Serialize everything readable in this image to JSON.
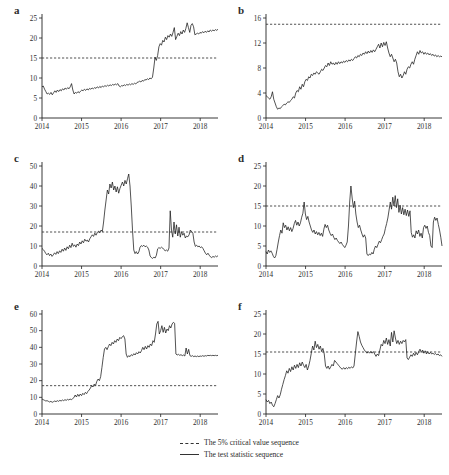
{
  "figure": {
    "panels": [
      {
        "id": "a",
        "label": "a",
        "ylim": [
          0,
          25
        ],
        "yticks": [
          0,
          5,
          10,
          15,
          20,
          25
        ],
        "xticks": [
          "2014",
          "2015",
          "2016",
          "2017",
          "2018"
        ],
        "critical_value": 15,
        "series_name": "The test statistic sequence",
        "values": [
          7.8,
          8.0,
          7.2,
          6.6,
          6.0,
          6.2,
          5.9,
          6.4,
          5.8,
          6.3,
          6.8,
          6.4,
          7.0,
          6.6,
          7.1,
          6.8,
          7.3,
          7.0,
          7.5,
          7.2,
          7.6,
          7.3,
          7.8,
          8.6,
          7.0,
          6.0,
          6.4,
          6.2,
          6.6,
          6.3,
          6.7,
          7.0,
          6.8,
          7.2,
          6.9,
          7.3,
          7.0,
          7.4,
          7.2,
          7.5,
          7.3,
          7.6,
          7.4,
          7.8,
          7.5,
          7.9,
          7.6,
          8.0,
          7.8,
          8.1,
          7.9,
          8.2,
          8.0,
          8.3,
          8.1,
          8.4,
          8.2,
          8.5,
          8.3,
          8.6,
          8.0,
          7.8,
          8.1,
          8.0,
          8.3,
          8.1,
          8.4,
          8.2,
          8.5,
          8.3,
          8.6,
          8.4,
          8.7,
          8.5,
          8.9,
          9.0,
          9.2,
          9.0,
          9.4,
          9.2,
          9.6,
          9.5,
          9.8,
          9.6,
          10.0,
          9.8,
          10.2,
          12.5,
          15.2,
          14.4,
          15.6,
          17.8,
          18.6,
          18.2,
          19.4,
          19.0,
          20.2,
          19.6,
          20.6,
          20.2,
          21.0,
          20.4,
          21.4,
          22.6,
          19.6,
          20.4,
          21.2,
          20.6,
          21.6,
          21.0,
          22.0,
          21.4,
          22.4,
          23.8,
          22.6,
          21.4,
          23.2,
          23.6,
          22.8,
          20.8,
          21.0,
          21.2,
          21.0,
          21.4,
          21.2,
          21.6,
          21.3,
          21.7,
          21.4,
          21.8,
          21.5,
          22.0,
          21.7,
          22.0,
          21.8,
          22.1,
          21.9,
          22.2
        ]
      },
      {
        "id": "b",
        "label": "b",
        "ylim": [
          0,
          16
        ],
        "yticks": [
          0,
          4,
          8,
          12,
          16
        ],
        "xticks": [
          "2014",
          "2015",
          "2016",
          "2017",
          "2018"
        ],
        "critical_value": 15,
        "series_name": "The test statistic sequence",
        "values": [
          3.6,
          3.4,
          3.2,
          3.0,
          3.4,
          4.2,
          3.0,
          2.4,
          1.8,
          1.4,
          1.6,
          1.5,
          1.8,
          2.0,
          2.2,
          2.1,
          2.4,
          2.6,
          2.5,
          2.8,
          3.0,
          3.4,
          3.2,
          4.0,
          4.4,
          4.2,
          5.0,
          4.6,
          5.4,
          5.0,
          5.8,
          6.2,
          6.0,
          6.6,
          6.4,
          7.0,
          6.8,
          7.2,
          7.0,
          7.4,
          7.2,
          7.0,
          7.4,
          7.8,
          7.6,
          8.0,
          8.4,
          8.2,
          8.8,
          8.4,
          9.0,
          8.6,
          8.8,
          8.5,
          8.9,
          8.6,
          9.0,
          8.7,
          9.0,
          8.8,
          9.1,
          8.9,
          9.2,
          9.0,
          9.3,
          9.1,
          9.4,
          9.2,
          9.5,
          9.8,
          9.6,
          10.0,
          9.8,
          10.2,
          10.0,
          10.4,
          10.2,
          10.6,
          10.3,
          10.7,
          10.4,
          10.8,
          10.5,
          10.9,
          10.6,
          11.0,
          11.4,
          11.8,
          11.2,
          12.0,
          11.4,
          12.1,
          11.6,
          12.2,
          11.2,
          10.4,
          9.8,
          10.2,
          9.6,
          9.0,
          9.4,
          8.8,
          7.4,
          6.6,
          7.0,
          6.4,
          6.8,
          7.4,
          7.0,
          7.8,
          8.2,
          8.0,
          8.6,
          9.0,
          8.6,
          9.4,
          10.0,
          10.6,
          10.2,
          10.8,
          10.4,
          10.6,
          10.2,
          10.5,
          10.2,
          10.4,
          10.1,
          10.3,
          10.0,
          10.2,
          9.9,
          10.1,
          9.8,
          10.0,
          9.8,
          9.9,
          9.8
        ]
      },
      {
        "id": "c",
        "label": "c",
        "ylim": [
          0,
          50
        ],
        "yticks": [
          0,
          10,
          20,
          30,
          40,
          50
        ],
        "xticks": [
          "2014",
          "2015",
          "2016",
          "2017",
          "2018"
        ],
        "critical_value": 17,
        "series_name": "The test statistic sequence",
        "values": [
          8.8,
          8.2,
          7.4,
          6.2,
          5.6,
          6.4,
          5.2,
          6.0,
          4.8,
          5.6,
          6.6,
          5.8,
          7.2,
          6.2,
          7.6,
          6.8,
          8.4,
          7.4,
          9.0,
          7.8,
          9.6,
          8.6,
          10.4,
          9.2,
          11.4,
          9.8,
          10.6,
          9.4,
          11.0,
          10.2,
          12.0,
          11.0,
          12.6,
          11.6,
          13.4,
          12.4,
          13.0,
          12.0,
          13.6,
          14.6,
          15.6,
          14.8,
          16.4,
          15.4,
          16.8,
          17.4,
          16.6,
          18.0,
          17.2,
          22.0,
          28.0,
          33.0,
          38.0,
          36.0,
          41.0,
          39.0,
          42.0,
          38.0,
          40.0,
          37.0,
          39.6,
          36.4,
          38.8,
          40.4,
          42.0,
          40.0,
          42.8,
          41.0,
          43.6,
          46.0,
          40.0,
          30.0,
          18.0,
          8.0,
          6.2,
          7.2,
          6.0,
          7.0,
          9.4,
          10.2,
          9.8,
          10.4,
          9.6,
          10.0,
          9.4,
          8.0,
          5.0,
          4.2,
          3.8,
          4.4,
          4.0,
          5.4,
          8.6,
          9.2,
          8.8,
          9.4,
          9.0,
          8.2,
          7.6,
          8.0,
          7.4,
          9.0,
          27.6,
          18.0,
          14.4,
          22.0,
          16.0,
          20.6,
          15.0,
          19.4,
          14.4,
          17.2,
          15.4,
          16.4,
          14.0,
          15.0,
          14.6,
          15.6,
          18.0,
          17.2,
          16.4,
          12.0,
          9.8,
          10.4,
          9.6,
          10.0,
          9.2,
          9.6,
          8.8,
          7.6,
          6.4,
          5.6,
          6.4,
          5.4,
          4.6,
          4.2,
          4.8,
          4.4,
          5.0,
          4.6,
          5.2
        ]
      },
      {
        "id": "d",
        "label": "d",
        "ylim": [
          0,
          25
        ],
        "yticks": [
          0,
          5,
          10,
          15,
          20,
          25
        ],
        "xticks": [
          "2014",
          "2015",
          "2016",
          "2017",
          "2018"
        ],
        "critical_value": 15,
        "series_name": "The test statistic sequence",
        "values": [
          3.6,
          3.0,
          4.0,
          3.4,
          3.8,
          3.2,
          2.4,
          2.0,
          2.6,
          4.2,
          6.0,
          7.6,
          9.0,
          8.2,
          10.8,
          9.6,
          10.2,
          9.0,
          9.8,
          8.8,
          9.6,
          8.6,
          9.4,
          10.6,
          11.4,
          10.2,
          11.0,
          10.0,
          10.8,
          12.2,
          13.2,
          16.0,
          13.0,
          11.6,
          12.4,
          11.0,
          10.0,
          9.0,
          8.4,
          9.0,
          8.0,
          8.6,
          7.8,
          8.4,
          7.6,
          8.2,
          7.4,
          9.2,
          10.4,
          9.6,
          10.2,
          9.0,
          8.2,
          7.6,
          8.0,
          7.2,
          6.6,
          7.0,
          6.4,
          6.0,
          5.6,
          6.0,
          5.4,
          5.0,
          4.6,
          5.2,
          6.0,
          10.0,
          16.0,
          20.0,
          17.0,
          14.6,
          16.2,
          13.0,
          11.0,
          9.6,
          10.2,
          9.0,
          8.0,
          7.2,
          7.8,
          7.0,
          3.0,
          2.6,
          3.0,
          2.8,
          3.4,
          3.0,
          4.2,
          5.0,
          4.6,
          5.4,
          6.2,
          5.8,
          6.6,
          7.4,
          8.0,
          9.4,
          10.6,
          12.0,
          14.0,
          16.0,
          14.2,
          17.2,
          15.0,
          17.6,
          14.6,
          16.8,
          13.4,
          15.2,
          13.0,
          14.6,
          12.8,
          14.2,
          12.6,
          14.0,
          12.4,
          13.8,
          8.4,
          7.2,
          7.8,
          7.0,
          8.8,
          8.0,
          9.0,
          7.4,
          8.2,
          7.0,
          9.6,
          10.2,
          9.4,
          10.0,
          8.4,
          7.6,
          5.0,
          4.6,
          11.0,
          12.2,
          11.4,
          12.0,
          10.4,
          9.0,
          7.2,
          5.0
        ]
      },
      {
        "id": "e",
        "label": "e",
        "ylim": [
          0,
          60
        ],
        "yticks": [
          0,
          10,
          20,
          30,
          40,
          50,
          60
        ],
        "xticks": [
          "2014",
          "2015",
          "2016",
          "2017",
          "2018"
        ],
        "critical_value": 17,
        "series_name": "The test statistic sequence",
        "values": [
          9.0,
          8.6,
          8.2,
          7.8,
          8.0,
          7.6,
          7.2,
          7.6,
          7.0,
          7.4,
          7.8,
          7.4,
          8.0,
          7.6,
          8.2,
          7.8,
          8.4,
          8.0,
          8.6,
          8.2,
          8.8,
          8.4,
          9.0,
          8.6,
          9.2,
          9.8,
          11.4,
          10.2,
          11.8,
          10.6,
          12.0,
          11.0,
          12.4,
          11.6,
          13.0,
          12.2,
          13.6,
          14.4,
          15.6,
          17.0,
          16.2,
          18.0,
          17.2,
          19.6,
          21.0,
          20.0,
          22.4,
          28.0,
          34.0,
          39.0,
          40.0,
          38.6,
          40.4,
          42.0,
          41.0,
          43.0,
          42.0,
          44.0,
          43.0,
          45.0,
          44.0,
          46.0,
          45.2,
          46.4,
          47.0,
          45.0,
          36.0,
          34.0,
          35.0,
          34.4,
          35.6,
          35.0,
          36.2,
          35.4,
          36.8,
          36.0,
          37.4,
          36.6,
          38.0,
          40.0,
          38.6,
          40.6,
          39.0,
          41.0,
          40.0,
          42.0,
          41.0,
          44.0,
          43.0,
          48.0,
          54.0,
          55.6,
          48.0,
          50.0,
          53.0,
          49.0,
          52.0,
          48.6,
          51.0,
          50.0,
          53.0,
          51.6,
          54.0,
          55.0,
          54.4,
          36.0,
          35.4,
          35.8,
          35.2,
          35.6,
          35.0,
          35.4,
          34.8,
          39.6,
          36.0,
          38.8,
          35.0,
          34.6,
          35.0,
          34.4,
          34.8,
          34.4,
          34.8,
          34.4,
          34.8,
          34.6,
          35.0,
          34.6,
          35.0,
          34.8,
          35.2,
          35.0,
          35.2,
          35.0,
          35.2,
          35.0,
          35.2,
          35.0,
          35.2
        ]
      },
      {
        "id": "f",
        "label": "f",
        "ylim": [
          0,
          25
        ],
        "yticks": [
          0,
          5,
          10,
          15,
          20,
          25
        ],
        "xticks": [
          "2014",
          "2015",
          "2016",
          "2017",
          "2018"
        ],
        "critical_value": 15.5,
        "series_name": "The test statistic sequence",
        "values": [
          3.6,
          3.0,
          3.4,
          2.6,
          3.0,
          2.2,
          1.8,
          2.6,
          3.6,
          4.6,
          4.0,
          4.8,
          6.2,
          7.4,
          8.6,
          9.6,
          10.8,
          10.2,
          11.4,
          10.6,
          11.8,
          11.0,
          12.2,
          11.4,
          12.4,
          11.6,
          12.8,
          12.0,
          13.0,
          12.2,
          11.6,
          12.4,
          11.0,
          12.0,
          13.4,
          15.2,
          17.0,
          16.0,
          18.2,
          16.6,
          17.4,
          16.2,
          17.0,
          15.6,
          16.4,
          15.0,
          12.0,
          11.4,
          12.0,
          11.2,
          11.8,
          12.4,
          12.0,
          13.4,
          13.0,
          12.6,
          12.2,
          11.8,
          11.4,
          11.2,
          11.6,
          11.2,
          11.6,
          11.3,
          11.7,
          11.4,
          11.8,
          11.5,
          12.0,
          15.0,
          18.0,
          20.6,
          19.4,
          18.0,
          17.2,
          16.6,
          16.0,
          15.6,
          15.2,
          15.6,
          15.2,
          15.6,
          15.2,
          15.6,
          15.0,
          14.4,
          15.0,
          14.6,
          16.0,
          17.4,
          17.0,
          18.4,
          17.6,
          19.0,
          17.4,
          18.6,
          17.0,
          20.4,
          18.0,
          20.8,
          19.0,
          17.6,
          18.4,
          17.4,
          18.2,
          17.6,
          18.4,
          18.0,
          18.6,
          14.0,
          13.6,
          14.2,
          14.8,
          14.4,
          15.2,
          14.6,
          15.4,
          14.8,
          15.6,
          16.2,
          15.4,
          16.0,
          15.2,
          15.8,
          15.0,
          15.6,
          15.0,
          15.4,
          15.0,
          15.2,
          14.9,
          15.1,
          14.8,
          15.0,
          14.6,
          14.8,
          14.4
        ]
      }
    ],
    "legend": {
      "items": [
        {
          "style": "dashed",
          "label": "The 5% critical value sequence"
        },
        {
          "style": "solid",
          "label": "The test statistic sequence"
        }
      ]
    },
    "colors": {
      "line": "#1a1a1a",
      "critical": "#333333",
      "axis": "#222222",
      "text": "#2e2e2e"
    }
  }
}
